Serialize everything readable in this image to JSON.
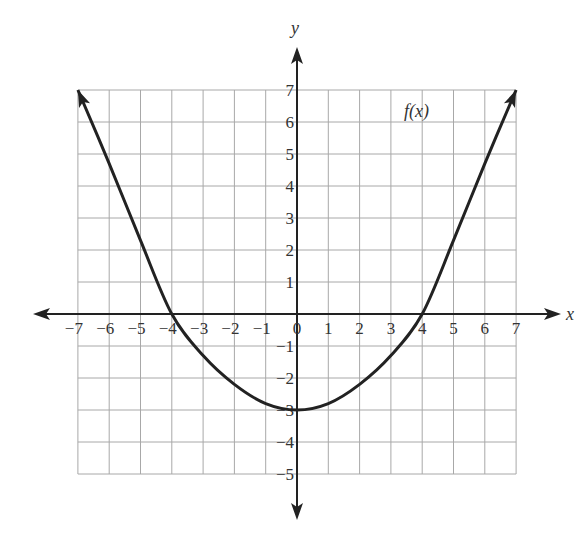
{
  "chart_data": {
    "type": "line",
    "title": "",
    "xlabel": "x",
    "ylabel": "y",
    "xlim": [
      -7,
      7
    ],
    "ylim": [
      -5,
      7
    ],
    "grid": true,
    "x_ticks": [
      "-7",
      "-6",
      "-5",
      "-4",
      "-3",
      "-2",
      "-1",
      "0",
      "1",
      "2",
      "3",
      "4",
      "5",
      "6",
      "7"
    ],
    "y_ticks": [
      "-5",
      "-4",
      "-3",
      "-2",
      "-1",
      "1",
      "2",
      "3",
      "4",
      "5",
      "6",
      "7"
    ],
    "series": [
      {
        "name": "f(x)",
        "x": [
          -7,
          -6,
          -5,
          -4,
          -3,
          -2,
          -1,
          0,
          1,
          2,
          3,
          4,
          5,
          6,
          7
        ],
        "y": [
          7,
          4.7,
          2.3,
          0,
          -1.3,
          -2.2,
          -2.8,
          -3,
          -2.8,
          -2.2,
          -1.3,
          0,
          2.3,
          4.7,
          7
        ]
      }
    ],
    "annotations": [
      {
        "text": "f(x)",
        "x": 4.5,
        "y": 6.4
      }
    ],
    "key_points": {
      "x_intercepts": [
        -4,
        4
      ],
      "minimum": [
        0,
        -3
      ]
    },
    "colors": {
      "curve": "#222222",
      "grid": "#a8a8a8",
      "axis": "#222222"
    }
  }
}
